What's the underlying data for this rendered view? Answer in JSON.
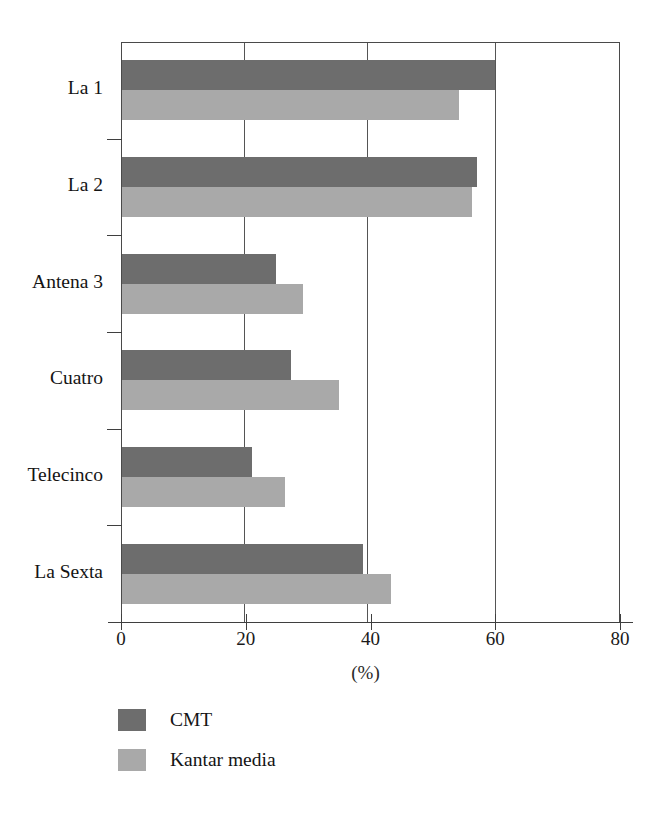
{
  "chart_data": {
    "type": "bar",
    "orientation": "horizontal",
    "title": "",
    "subtitle": "",
    "xlabel": "(%)",
    "ylabel": "",
    "xlim": [
      0,
      80
    ],
    "xticks": [
      0,
      20,
      40,
      60,
      80
    ],
    "xtick_labels": [
      "0",
      "20",
      "40",
      "60",
      "80"
    ],
    "grid": true,
    "grid_axis": "x",
    "legend_position": "bottom-left",
    "categories": [
      "La 1",
      "La 2",
      "Antena 3",
      "Cuatro",
      "Telecinco",
      "La Sexta"
    ],
    "series": [
      {
        "name": "CMT",
        "color": "#6d6d6d",
        "values": [
          60.0,
          57.0,
          24.8,
          27.2,
          21.0,
          38.8
        ]
      },
      {
        "name": "Kantar media",
        "color": "#a9a9a9",
        "values": [
          54.2,
          56.3,
          29.2,
          34.9,
          26.3,
          43.3
        ]
      }
    ],
    "annotations": []
  },
  "legend": {
    "items": [
      {
        "label": "CMT",
        "color": "#6d6d6d"
      },
      {
        "label": "Kantar media",
        "color": "#a9a9a9"
      }
    ]
  },
  "axis": {
    "x_title": "(%)"
  }
}
